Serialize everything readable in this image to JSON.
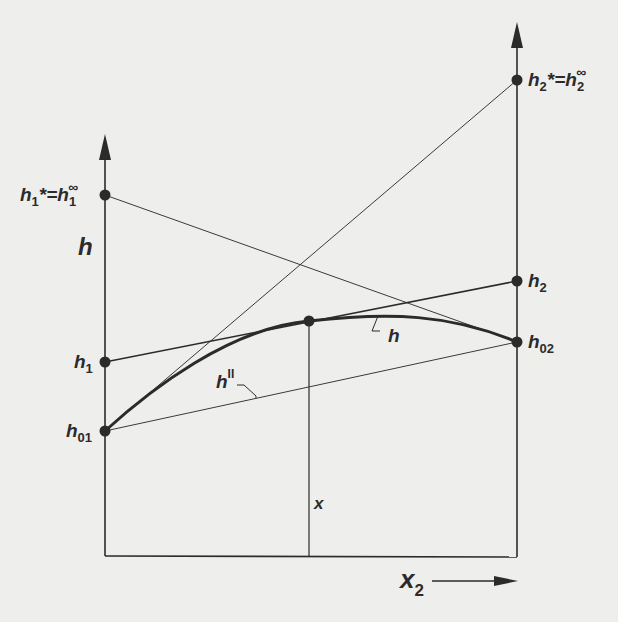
{
  "figure": {
    "axis_y_label": "h",
    "axis_x_label": "x",
    "axis_x_sub": "2",
    "vertical_marker_label": "x",
    "curve_label": "h",
    "chord_label": "h",
    "chord_label_sup": "II",
    "points": {
      "h1_star": {
        "label_main": "h",
        "label_sub": "1",
        "label_rest": "*=h",
        "label_sub2": "1",
        "label_sup": "∞"
      },
      "h2_star": {
        "label_main": "h",
        "label_sub": "2",
        "label_rest": "*=h",
        "label_sub2": "2",
        "label_sup": "∞"
      },
      "h1": {
        "label_main": "h",
        "label_sub": "1"
      },
      "h2": {
        "label_main": "h",
        "label_sub": "2"
      },
      "h01": {
        "label_main": "h",
        "label_sub": "01"
      },
      "h02": {
        "label_main": "h",
        "label_sub": "02"
      }
    },
    "colors": {
      "background": "#eeeeec",
      "ink": "#2b2b2b"
    }
  }
}
